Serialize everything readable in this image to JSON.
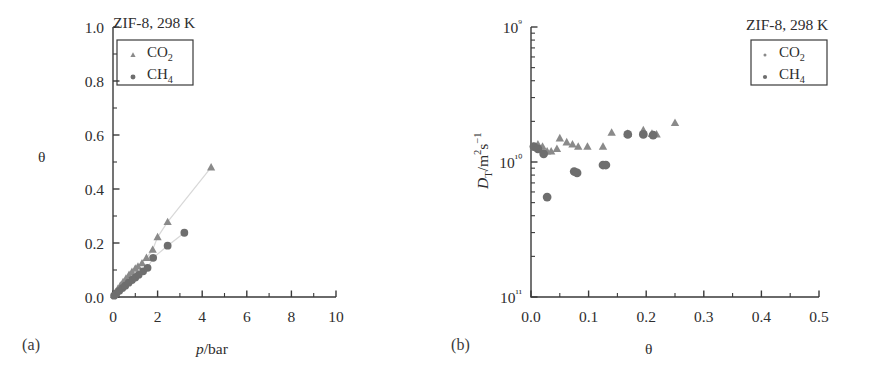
{
  "figure": {
    "panels": [
      {
        "caption": "(a)",
        "title": "ZIF-8, 298 K",
        "xlabel_italic": "p",
        "xlabel_rest": "/bar",
        "ylabel": "θ",
        "xticks": [
          "0",
          "2",
          "4",
          "6",
          "8",
          "10"
        ],
        "yticks": [
          "0.0",
          "0.2",
          "0.4",
          "0.6",
          "0.8",
          "1.0"
        ],
        "legend": [
          {
            "name": "CO",
            "sub": "2",
            "marker": "triangle"
          },
          {
            "name": "CH",
            "sub": "4",
            "marker": "circle"
          }
        ]
      },
      {
        "caption": "(b)",
        "title": "ZIF-8, 298 K",
        "xlabel": "θ",
        "ylabel_italic": "D",
        "ylabel_sub": "T",
        "ylabel_rest": "/m",
        "ylabel_sup1": "2",
        "ylabel_rest2": "s",
        "ylabel_sup2": "−1",
        "xticks": [
          "0.0",
          "0.1",
          "0.2",
          "0.3",
          "0.4",
          "0.5"
        ],
        "yticks": [
          "10⁹",
          "10¹⁰",
          "10¹¹"
        ],
        "legend": [
          {
            "name": "CO",
            "sub": "2",
            "marker": "triangle"
          },
          {
            "name": "CH",
            "sub": "4",
            "marker": "circle"
          }
        ]
      }
    ],
    "colors": {
      "axis": "#3a3a3a",
      "co2_marker": "#8a8a8a",
      "ch4_marker": "#6e6e6e",
      "connector": "#d8d8d8",
      "text": "#2e2e2e"
    }
  },
  "chart_data": [
    {
      "type": "scatter",
      "panel": "a",
      "title": "ZIF-8, 298 K",
      "xlabel": "p/bar",
      "ylabel": "θ",
      "xlim": [
        0,
        10
      ],
      "ylim": [
        0.0,
        1.0
      ],
      "xticks": [
        0,
        2,
        4,
        6,
        8,
        10
      ],
      "yticks": [
        0.0,
        0.2,
        0.4,
        0.6,
        0.8,
        1.0
      ],
      "grid": false,
      "legend_position": "upper-left",
      "series": [
        {
          "name": "CO2",
          "marker": "triangle",
          "connected": true,
          "x": [
            0.05,
            0.12,
            0.22,
            0.33,
            0.45,
            0.58,
            0.72,
            0.85,
            1.0,
            1.12,
            1.3,
            1.5,
            1.78,
            2.0,
            2.45,
            4.4
          ],
          "y": [
            0.008,
            0.018,
            0.03,
            0.042,
            0.055,
            0.068,
            0.082,
            0.093,
            0.105,
            0.113,
            0.125,
            0.145,
            0.175,
            0.222,
            0.278,
            0.48
          ]
        },
        {
          "name": "CH4",
          "marker": "circle",
          "connected": true,
          "x": [
            0.05,
            0.15,
            0.28,
            0.42,
            0.55,
            0.7,
            0.85,
            1.0,
            1.15,
            1.35,
            1.55,
            1.8,
            2.45,
            3.2
          ],
          "y": [
            0.005,
            0.013,
            0.023,
            0.033,
            0.042,
            0.053,
            0.063,
            0.072,
            0.082,
            0.095,
            0.108,
            0.145,
            0.19,
            0.238
          ]
        }
      ]
    },
    {
      "type": "scatter",
      "panel": "b",
      "title": "ZIF-8, 298 K",
      "xlabel": "θ",
      "ylabel": "D_T/m2s-1",
      "xlim": [
        0.0,
        0.5
      ],
      "ylim": [
        1e-11,
        1e-09
      ],
      "yscale": "log",
      "xticks": [
        0.0,
        0.1,
        0.2,
        0.3,
        0.4,
        0.5
      ],
      "yticks": [
        1e-09,
        1e-10,
        1e-11
      ],
      "ytick_labels": [
        "10⁹",
        "10¹⁰",
        "10¹¹"
      ],
      "grid": false,
      "legend_position": "upper-right",
      "series": [
        {
          "name": "CO2",
          "marker": "triangle",
          "connected": false,
          "x": [
            0.005,
            0.012,
            0.02,
            0.028,
            0.035,
            0.045,
            0.05,
            0.062,
            0.072,
            0.082,
            0.098,
            0.125,
            0.14,
            0.168,
            0.195,
            0.21,
            0.218,
            0.25
          ],
          "y": [
            1.3e-10,
            1.35e-10,
            1.3e-10,
            1.2e-10,
            1.2e-10,
            1.25e-10,
            1.5e-10,
            1.4e-10,
            1.35e-10,
            1.3e-10,
            1.3e-10,
            1.3e-10,
            1.65e-10,
            1.62e-10,
            1.72e-10,
            1.62e-10,
            1.6e-10,
            1.95e-10
          ]
        },
        {
          "name": "CH4",
          "marker": "circle",
          "connected": false,
          "x": [
            0.005,
            0.012,
            0.022,
            0.028,
            0.075,
            0.08,
            0.125,
            0.13,
            0.168,
            0.195,
            0.212
          ],
          "y": [
            1.3e-10,
            1.25e-10,
            1.15e-10,
            5.5e-11,
            8.5e-11,
            8.3e-11,
            9.5e-11,
            9.5e-11,
            1.6e-10,
            1.6e-10,
            1.58e-10
          ]
        }
      ]
    }
  ]
}
